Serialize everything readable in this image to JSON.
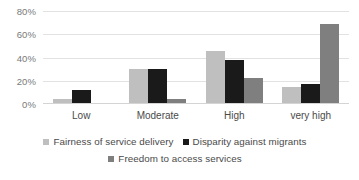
{
  "chart_data": {
    "type": "bar",
    "title": "",
    "subtitle": "",
    "xlabel": "",
    "ylabel": "",
    "categories": [
      "Low",
      "Moderate",
      "High",
      "very high"
    ],
    "series": [
      {
        "name": "Fairness of service delivery",
        "color": "#bfbfbf",
        "values": [
          4,
          30,
          46,
          15
        ]
      },
      {
        "name": "Disparity against migrants",
        "color": "#1a1a1a",
        "values": [
          12,
          30,
          38,
          17
        ]
      },
      {
        "name": "Freedom to access services",
        "color": "#7f7f7f",
        "values": [
          1,
          4,
          22,
          69
        ]
      }
    ],
    "ylim": [
      0,
      80
    ],
    "yticks": [
      0,
      20,
      40,
      60,
      80
    ],
    "ytick_labels": [
      "0%",
      "20%",
      "40%",
      "60%",
      "80%"
    ],
    "grid": true,
    "legend_position": "bottom",
    "value_suffix": "%"
  },
  "colors": {
    "background": "#ffffff",
    "gridline": "#e2e2e2",
    "axis": "#d4d4d4",
    "tick_text": "#7a7a7a",
    "label_text": "#4a4a4a"
  }
}
